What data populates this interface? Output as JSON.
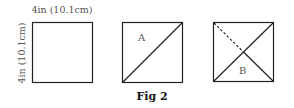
{
  "figure": {
    "caption": "Fig 2",
    "width_label": "4in (10.1cm)",
    "height_label": "4in (10.1cm)",
    "panels": [
      {
        "id": "square",
        "description": "plain square",
        "label": ""
      },
      {
        "id": "fold-a",
        "description": "square with diagonal fold",
        "label": "A"
      },
      {
        "id": "fold-b",
        "description": "square with both diagonals, one partly dashed",
        "label": "B"
      }
    ],
    "colors": {
      "line": "#222222",
      "text": "#555555",
      "caption": "#111111"
    }
  }
}
